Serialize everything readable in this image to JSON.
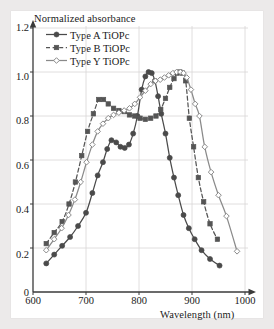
{
  "figure": {
    "background_color": "#eceaea",
    "panel_color": "#ffffff",
    "grid_color": "#d8d6d6",
    "axis_color": "#3a3a3a"
  },
  "chart_data": {
    "type": "line",
    "title": "Normalized absorbance",
    "xlabel": "Wavelength (nm)",
    "ylabel": "Normalized absorbance",
    "xlim": [
      600,
      1000
    ],
    "ylim": [
      0,
      1.2
    ],
    "xticks": [
      600,
      700,
      800,
      900,
      1000
    ],
    "yticks": [
      0,
      0.2,
      0.4,
      0.6,
      0.8,
      1.0,
      1.2
    ],
    "xtick_labels": [
      "600",
      "700",
      "800",
      "900",
      "1000"
    ],
    "ytick_labels": [
      "0",
      "0.2",
      "0.4",
      "0.6",
      "0.8",
      "1.0",
      "1.2"
    ],
    "grid": true,
    "legend_position": "upper-left-inside",
    "series": [
      {
        "name": "Type A TiOPc",
        "color": "#4a4a4a",
        "linestyle": "solid",
        "marker": "filled-circle",
        "x": [
          625,
          640,
          655,
          670,
          685,
          700,
          712,
          722,
          732,
          740,
          748,
          757,
          765,
          773,
          781,
          789,
          797,
          805,
          812,
          818,
          824,
          830,
          836,
          842,
          850,
          858,
          866,
          874,
          884,
          894,
          905,
          918,
          934,
          952
        ],
        "y": [
          0.13,
          0.17,
          0.21,
          0.25,
          0.3,
          0.36,
          0.45,
          0.53,
          0.59,
          0.65,
          0.69,
          0.68,
          0.66,
          0.655,
          0.67,
          0.72,
          0.8,
          0.92,
          0.98,
          1.0,
          0.995,
          0.96,
          0.89,
          0.81,
          0.72,
          0.61,
          0.52,
          0.44,
          0.35,
          0.29,
          0.24,
          0.19,
          0.15,
          0.12
        ]
      },
      {
        "name": "Type B TiOPc",
        "color": "#555555",
        "linestyle": "dashed",
        "marker": "filled-square",
        "x": [
          625,
          640,
          655,
          668,
          680,
          692,
          703,
          714,
          724,
          733,
          742,
          752,
          762,
          772,
          782,
          792,
          802,
          812,
          822,
          832,
          841,
          850,
          858,
          866,
          872,
          877,
          882,
          888,
          895,
          903,
          912,
          922,
          934,
          948
        ],
        "y": [
          0.22,
          0.27,
          0.32,
          0.4,
          0.5,
          0.62,
          0.73,
          0.81,
          0.875,
          0.875,
          0.855,
          0.835,
          0.825,
          0.82,
          0.805,
          0.8,
          0.79,
          0.785,
          0.79,
          0.8,
          0.83,
          0.88,
          0.93,
          0.97,
          0.995,
          1.0,
          0.995,
          0.96,
          0.79,
          0.66,
          0.52,
          0.41,
          0.31,
          0.24
        ]
      },
      {
        "name": "Type Y TiOPc",
        "color": "#8a8a8a",
        "linestyle": "solid",
        "marker": "open-diamond",
        "x": [
          625,
          640,
          654,
          667,
          679,
          690,
          701,
          712,
          722,
          732,
          742,
          752,
          762,
          772,
          782,
          792,
          802,
          812,
          822,
          831,
          840,
          848,
          856,
          864,
          871,
          878,
          884,
          890,
          898,
          906,
          914,
          924,
          936,
          950,
          965,
          985
        ],
        "y": [
          0.19,
          0.24,
          0.29,
          0.35,
          0.42,
          0.5,
          0.59,
          0.67,
          0.73,
          0.765,
          0.79,
          0.805,
          0.815,
          0.825,
          0.835,
          0.855,
          0.885,
          0.915,
          0.945,
          0.96,
          0.965,
          0.975,
          0.985,
          0.995,
          1.0,
          1.0,
          0.995,
          0.975,
          0.92,
          0.855,
          0.8,
          0.66,
          0.545,
          0.44,
          0.345,
          0.185
        ]
      }
    ]
  },
  "legend": {
    "items": [
      {
        "label": "Type A TiOPc"
      },
      {
        "label": "Type B TiOPc"
      },
      {
        "label": "Type Y TiOPc"
      }
    ]
  }
}
